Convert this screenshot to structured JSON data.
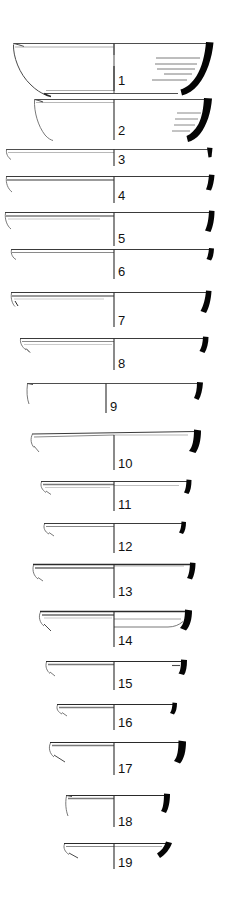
{
  "plate": {
    "type": "archaeological-pottery-profile-plate",
    "description": "Line-drawing plate of 19 numbered ceramic vessel rim and body profiles; left half shows exterior outline, right half shows sectioned (blackened) rim profile with interior hatching.",
    "background_color": "#ffffff",
    "ink_color": "#111111",
    "section_fill_color": "#000000",
    "width": 225,
    "height": 903,
    "figure_count": 19,
    "labels": [
      {
        "n": "1",
        "x": 118,
        "y": 81
      },
      {
        "n": "2",
        "x": 118,
        "y": 131
      },
      {
        "n": "3",
        "x": 118,
        "y": 160
      },
      {
        "n": "4",
        "x": 118,
        "y": 196
      },
      {
        "n": "5",
        "x": 118,
        "y": 239
      },
      {
        "n": "6",
        "x": 118,
        "y": 272
      },
      {
        "n": "7",
        "x": 118,
        "y": 321
      },
      {
        "n": "8",
        "x": 118,
        "y": 364
      },
      {
        "n": "9",
        "x": 111,
        "y": 407
      },
      {
        "n": "10",
        "x": 118,
        "y": 464
      },
      {
        "n": "11",
        "x": 118,
        "y": 505
      },
      {
        "n": "12",
        "x": 118,
        "y": 547
      },
      {
        "n": "13",
        "x": 118,
        "y": 592
      },
      {
        "n": "14",
        "x": 118,
        "y": 641
      },
      {
        "n": "15",
        "x": 118,
        "y": 684
      },
      {
        "n": "16",
        "x": 118,
        "y": 723
      },
      {
        "n": "17",
        "x": 118,
        "y": 769
      },
      {
        "n": "18",
        "x": 118,
        "y": 822
      },
      {
        "n": "19",
        "x": 118,
        "y": 863
      }
    ],
    "figures": [
      {
        "id": 1,
        "kind": "deep-bowl-full-profile",
        "rim_y": 43,
        "axis_x": 114,
        "left_end_x": 13,
        "right_end_x": 213,
        "base_y": 93,
        "has_base": true,
        "hatch_lines": 5,
        "section_tip": "thick-curved-wall"
      },
      {
        "id": 2,
        "kind": "shallow-bowl-profile",
        "rim_y": 99,
        "axis_x": 114,
        "left_end_x": 34,
        "right_end_x": 213,
        "base_y": 140,
        "has_base": false,
        "hatch_lines": 4,
        "section_tip": "thick-curved-wall"
      },
      {
        "id": 3,
        "kind": "flat-rim-plate",
        "rim_y": 149,
        "axis_x": 114,
        "left_end_x": 6,
        "right_end_x": 208,
        "section_tip": "small-triangular-rim"
      },
      {
        "id": 4,
        "kind": "flat-rim-plate",
        "rim_y": 176,
        "axis_x": 114,
        "left_end_x": 6,
        "right_end_x": 210,
        "section_tip": "hooked-rim"
      },
      {
        "id": 5,
        "kind": "flat-rim-plate",
        "rim_y": 212,
        "axis_x": 114,
        "left_end_x": 5,
        "right_end_x": 210,
        "section_tip": "hooked-rim"
      },
      {
        "id": 6,
        "kind": "flat-rim-plate",
        "rim_y": 249,
        "axis_x": 114,
        "left_end_x": 11,
        "right_end_x": 210,
        "section_tip": "short-hooked-rim"
      },
      {
        "id": 7,
        "kind": "flat-rim-plate",
        "rim_y": 292,
        "axis_x": 114,
        "left_end_x": 11,
        "right_end_x": 207,
        "section_tip": "hooked-rim"
      },
      {
        "id": 8,
        "kind": "flat-rim-plate",
        "rim_y": 338,
        "axis_x": 114,
        "left_end_x": 20,
        "right_end_x": 204,
        "section_tip": "short-hooked-rim"
      },
      {
        "id": 9,
        "kind": "flat-rim-plate",
        "rim_y": 383,
        "axis_x": 106,
        "left_end_x": 27,
        "right_end_x": 199,
        "section_tip": "upright-rim"
      },
      {
        "id": 10,
        "kind": "flat-rim-plate",
        "rim_y": 433,
        "axis_x": 114,
        "left_end_x": 32,
        "right_end_x": 196,
        "section_tip": "large-hooked-rim"
      },
      {
        "id": 11,
        "kind": "flat-rim-plate",
        "rim_y": 481,
        "axis_x": 114,
        "left_end_x": 41,
        "right_end_x": 188,
        "section_tip": "short-hooked-rim"
      },
      {
        "id": 12,
        "kind": "flat-rim-plate",
        "rim_y": 523,
        "axis_x": 114,
        "left_end_x": 44,
        "right_end_x": 183,
        "section_tip": "small-rim"
      },
      {
        "id": 13,
        "kind": "flat-rim-plate",
        "rim_y": 564,
        "axis_x": 114,
        "left_end_x": 33,
        "right_end_x": 192,
        "section_tip": "short-hooked-rim"
      },
      {
        "id": 14,
        "kind": "flat-rim-plate-double-contour",
        "rim_y": 611,
        "axis_x": 114,
        "left_end_x": 40,
        "right_end_x": 187,
        "section_tip": "large-hooked-rim",
        "has_lower_contour": true
      },
      {
        "id": 15,
        "kind": "flat-rim-plate",
        "rim_y": 661,
        "axis_x": 114,
        "left_end_x": 46,
        "right_end_x": 183,
        "section_tip": "blocky-rim"
      },
      {
        "id": 16,
        "kind": "flat-rim-plate",
        "rim_y": 704,
        "axis_x": 114,
        "left_end_x": 57,
        "right_end_x": 174,
        "section_tip": "small-rim"
      },
      {
        "id": 17,
        "kind": "flat-rim-plate",
        "rim_y": 742,
        "axis_x": 114,
        "left_end_x": 50,
        "right_end_x": 181,
        "section_tip": "large-hooked-rim"
      },
      {
        "id": 18,
        "kind": "flat-rim-plate",
        "rim_y": 795,
        "axis_x": 114,
        "left_end_x": 66,
        "right_end_x": 166,
        "section_tip": "blocky-rim"
      },
      {
        "id": 19,
        "kind": "flat-rim-plate",
        "rim_y": 843,
        "axis_x": 114,
        "left_end_x": 64,
        "right_end_x": 168,
        "section_tip": "slanted-rim"
      }
    ]
  }
}
